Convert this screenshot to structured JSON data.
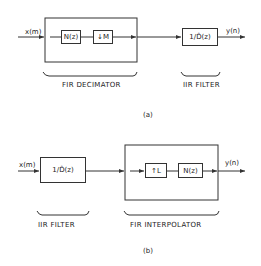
{
  "diagram_a": {
    "input_label": "x(m)",
    "output_label": "y(n)",
    "inner_blocks": [
      "N(z)",
      "↓M"
    ],
    "iir_block": "1/D̂(z)",
    "fir_caption": "FIR   DECIMATOR",
    "iir_caption": "IIR   FILTER",
    "sub_label": "(a)"
  },
  "diagram_b": {
    "input_label": "x(m)",
    "output_label": "y(n)",
    "iir_block": "1/D̂(z)",
    "inner_blocks": [
      "↑L",
      "N(z)"
    ],
    "iir_caption": "IIR   FILTER",
    "fir_caption": "FIR   INTERPOLATOR",
    "sub_label": "(b)"
  },
  "colors": {
    "line": "#333333",
    "background": "#ffffff"
  }
}
